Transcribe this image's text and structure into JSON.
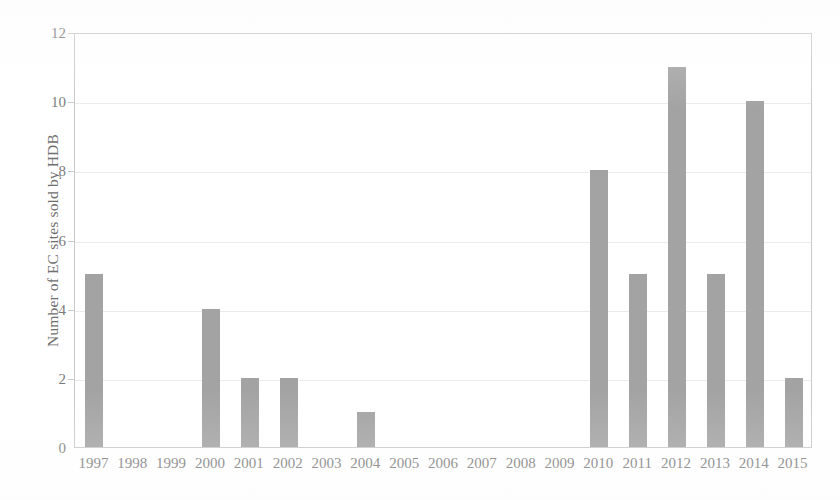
{
  "chart_data": {
    "type": "bar",
    "title": "",
    "subtitle": "",
    "xlabel": "",
    "ylabel": "Number of EC sites sold by HDB",
    "categories": [
      "1997",
      "1998",
      "1999",
      "2000",
      "2001",
      "2002",
      "2003",
      "2004",
      "2005",
      "2006",
      "2007",
      "2008",
      "2009",
      "2010",
      "2011",
      "2012",
      "2013",
      "2014",
      "2015"
    ],
    "values": [
      5,
      0,
      0,
      4,
      2,
      2,
      0,
      1,
      0,
      0,
      0,
      0,
      0,
      8,
      5,
      11,
      5,
      10,
      2
    ],
    "series": [
      {
        "name": "Number of EC sites sold by HDB",
        "values": [
          5,
          0,
          0,
          4,
          2,
          2,
          0,
          1,
          0,
          0,
          0,
          0,
          0,
          8,
          5,
          11,
          5,
          10,
          2
        ]
      }
    ],
    "ylim": [
      0,
      12
    ],
    "ytick_values": [
      0,
      2,
      4,
      6,
      8,
      10,
      12
    ],
    "ytick_labels": [
      "0",
      "2",
      "4",
      "6",
      "8",
      "10",
      "12"
    ],
    "xtick_labels": [
      "1997",
      "1998",
      "1999",
      "2000",
      "2001",
      "2002",
      "2003",
      "2004",
      "2005",
      "2006",
      "2007",
      "2008",
      "2009",
      "2010",
      "2011",
      "2012",
      "2013",
      "2014",
      "2015"
    ],
    "grid": "horizontal",
    "legend": "none",
    "legend_position": "none",
    "annotations": [],
    "colors": {
      "bar": "#a3a3a3",
      "gridline": "#ebebeb",
      "axis_line": "#c9c9c9",
      "tick_text": "#7b7b7b",
      "axis_title": "#6f6f6f",
      "background": "#ffffff"
    }
  }
}
